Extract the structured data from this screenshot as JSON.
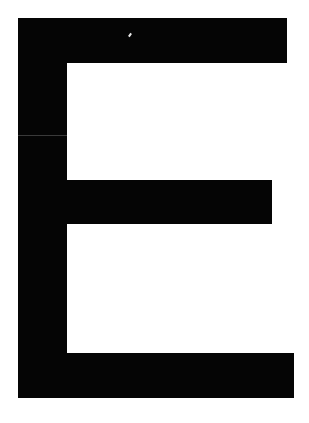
{
  "glyph": {
    "character": "E",
    "color": "#050505",
    "background": "#ffffff"
  }
}
